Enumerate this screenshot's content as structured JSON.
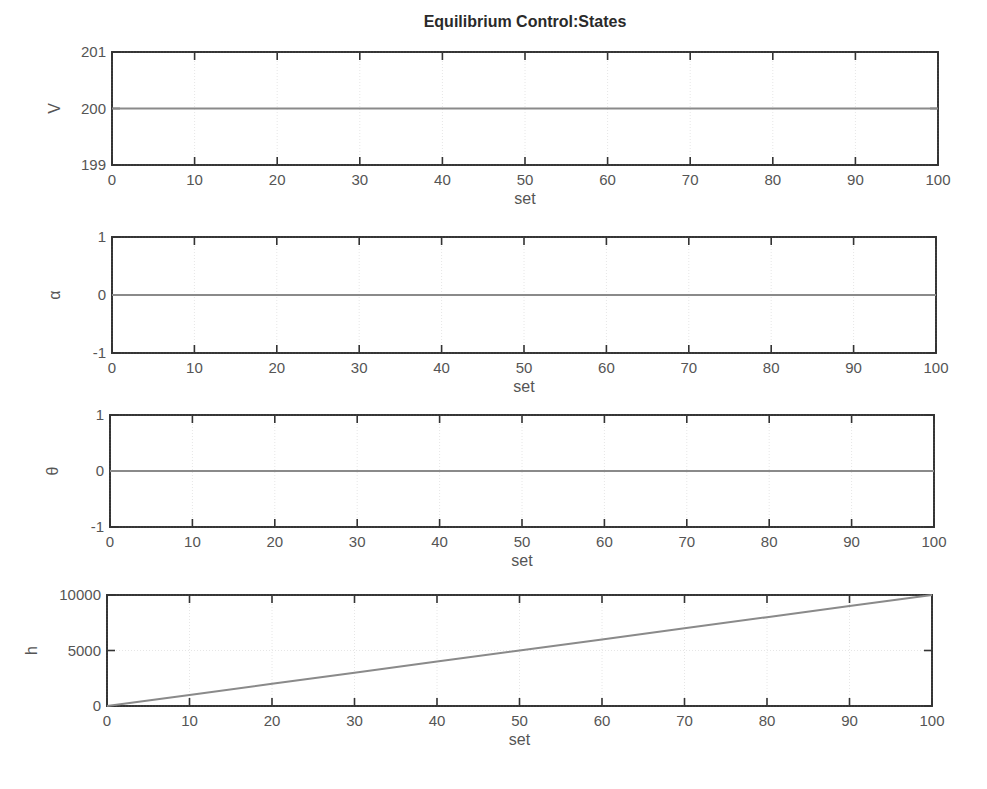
{
  "figure": {
    "title": "Equilibrium Control:States"
  },
  "chart_data": [
    {
      "type": "line",
      "title": "Equilibrium Control:States",
      "xlabel": "set",
      "ylabel": "V",
      "xlim": [
        0,
        100
      ],
      "ylim": [
        199,
        201
      ],
      "xticks": [
        "0",
        "10",
        "20",
        "30",
        "40",
        "50",
        "60",
        "70",
        "80",
        "90",
        "100"
      ],
      "yticks": [
        "199",
        "200",
        "201"
      ],
      "grid": true,
      "series": [
        {
          "name": "V",
          "x": [
            0,
            100
          ],
          "values": [
            200,
            200
          ]
        }
      ]
    },
    {
      "type": "line",
      "title": "",
      "xlabel": "set",
      "ylabel": "α",
      "xlim": [
        0,
        100
      ],
      "ylim": [
        -1,
        1
      ],
      "xticks": [
        "0",
        "10",
        "20",
        "30",
        "40",
        "50",
        "60",
        "70",
        "80",
        "90",
        "100"
      ],
      "yticks": [
        "-1",
        "0",
        "1"
      ],
      "grid": true,
      "series": [
        {
          "name": "alpha",
          "x": [
            0,
            100
          ],
          "values": [
            0,
            0
          ]
        }
      ]
    },
    {
      "type": "line",
      "title": "",
      "xlabel": "set",
      "ylabel": "θ",
      "xlim": [
        0,
        100
      ],
      "ylim": [
        -1,
        1
      ],
      "xticks": [
        "0",
        "10",
        "20",
        "30",
        "40",
        "50",
        "60",
        "70",
        "80",
        "90",
        "100"
      ],
      "yticks": [
        "-1",
        "0",
        "1"
      ],
      "grid": true,
      "series": [
        {
          "name": "theta",
          "x": [
            0,
            100
          ],
          "values": [
            0,
            0
          ]
        }
      ]
    },
    {
      "type": "line",
      "title": "",
      "xlabel": "set",
      "ylabel": "h",
      "xlim": [
        0,
        100
      ],
      "ylim": [
        0,
        10000
      ],
      "xticks": [
        "0",
        "10",
        "20",
        "30",
        "40",
        "50",
        "60",
        "70",
        "80",
        "90",
        "100"
      ],
      "yticks": [
        "0",
        "5000",
        "10000"
      ],
      "grid": true,
      "series": [
        {
          "name": "h",
          "x": [
            0,
            10,
            20,
            30,
            40,
            50,
            60,
            70,
            80,
            90,
            100
          ],
          "values": [
            0,
            1000,
            2000,
            3000,
            4000,
            5000,
            6000,
            7000,
            8000,
            9000,
            10000
          ]
        }
      ]
    }
  ],
  "layout": {
    "panels": [
      {
        "left": 112,
        "top": 52,
        "right": 938,
        "bottom": 165
      },
      {
        "left": 112,
        "top": 237,
        "right": 936,
        "bottom": 353
      },
      {
        "left": 110,
        "top": 415,
        "right": 934,
        "bottom": 527
      },
      {
        "left": 107,
        "top": 595,
        "right": 932,
        "bottom": 706
      }
    ],
    "line_color": "#8a8a8a",
    "axis_color": "#333333"
  }
}
